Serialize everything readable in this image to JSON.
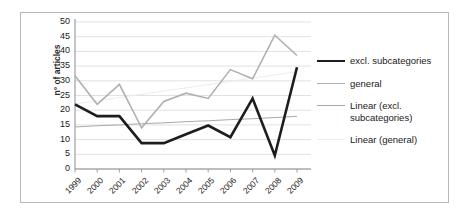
{
  "chart_data": {
    "type": "line",
    "title": "",
    "xlabel": "",
    "ylabel": "n° of articles",
    "categories": [
      "1999",
      "2000",
      "2001",
      "2002",
      "2003",
      "2004",
      "2005",
      "2006",
      "2007",
      "2008",
      "2009"
    ],
    "ylim": [
      0,
      50
    ],
    "ytick_step": 5,
    "yticks": [
      "50",
      "45",
      "40",
      "35",
      "30",
      "25",
      "20",
      "15",
      "10",
      "5",
      "0"
    ],
    "grid": true,
    "grid_axis": "y",
    "legend_position": "right",
    "series": [
      {
        "name": "excl. subcategories",
        "kind": "data",
        "color": "#1d1d1d",
        "width": 2.6,
        "values": [
          22,
          18,
          18,
          8.8,
          8.8,
          11.8,
          14.8,
          10.8,
          24,
          4.6,
          34.6
        ]
      },
      {
        "name": "general",
        "kind": "data",
        "color": "#b0b0b0",
        "width": 1.6,
        "values": [
          31.7,
          22,
          28.8,
          14,
          23,
          25.8,
          24,
          33.8,
          30.7,
          45.5,
          38.6
        ]
      },
      {
        "name": "Linear (excl. subcategories)",
        "kind": "trendline",
        "color": "#a9a9a9",
        "width": 1,
        "values": [
          14.3,
          14.7,
          15.0,
          15.4,
          15.7,
          16.1,
          16.4,
          16.8,
          17.1,
          17.5,
          17.9
        ]
      },
      {
        "name": "Linear (general)",
        "kind": "trendline",
        "color": "#ececec",
        "width": 1,
        "values": [
          22.1,
          23.2,
          24.3,
          25.4,
          26.5,
          27.6,
          28.7,
          29.8,
          30.9,
          32.0,
          33.1
        ]
      }
    ]
  },
  "legend": {
    "items": [
      {
        "label": "excl. subcategories",
        "swatch": "line-black-thick"
      },
      {
        "label": "general",
        "swatch": "line-gray-medium"
      },
      {
        "label": "Linear (excl. subcategories)",
        "swatch": "line-gray-thin"
      },
      {
        "label": "Linear (general)",
        "swatch": "line-lightgray-thin"
      }
    ]
  },
  "axes": {
    "y_title": "n° of articles"
  }
}
